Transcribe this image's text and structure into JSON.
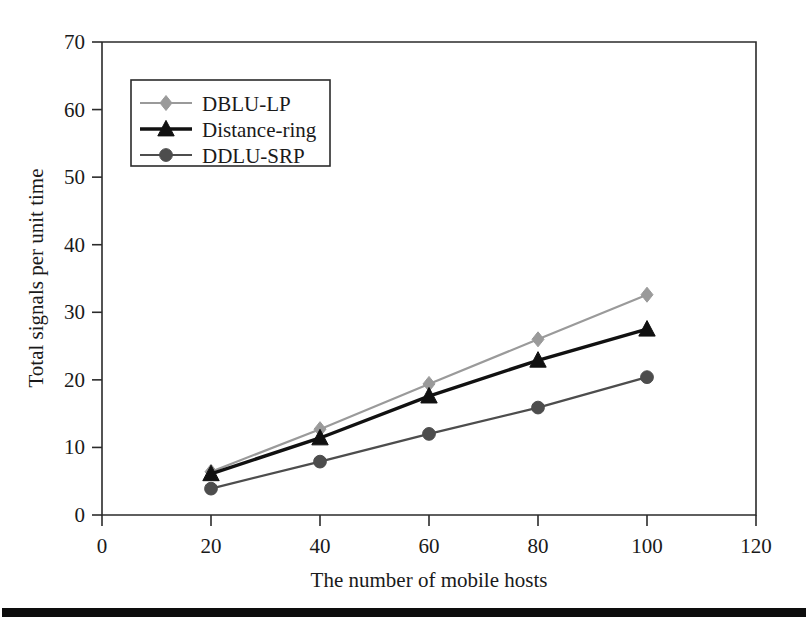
{
  "chart_data": {
    "type": "line",
    "title": "",
    "subtitle": "",
    "xlabel": "The number of mobile hosts",
    "ylabel": "Total signals per unit time",
    "x": [
      20,
      40,
      60,
      80,
      100
    ],
    "xlim": [
      0,
      120
    ],
    "ylim": [
      0,
      70
    ],
    "xticks": [
      0,
      20,
      40,
      60,
      80,
      100,
      120
    ],
    "yticks": [
      0,
      10,
      20,
      30,
      40,
      50,
      60,
      70
    ],
    "grid": false,
    "legend_position": "upper-left-inside",
    "series": [
      {
        "name": "DBLU-LP",
        "values": [
          6.4,
          12.7,
          19.4,
          26.0,
          32.6
        ],
        "color": "#9a9a9a",
        "marker": "diamond"
      },
      {
        "name": "Distance-ring",
        "values": [
          6.1,
          11.4,
          17.6,
          22.9,
          27.5
        ],
        "color": "#111111",
        "marker": "triangle"
      },
      {
        "name": "DDLU-SRP",
        "values": [
          3.9,
          7.9,
          12.0,
          15.9,
          20.4
        ],
        "color": "#4d4d4d",
        "marker": "circle"
      }
    ]
  },
  "axes": {
    "x_tick_labels": [
      "0",
      "20",
      "40",
      "60",
      "80",
      "100",
      "120"
    ],
    "y_tick_labels": [
      "0",
      "10",
      "20",
      "30",
      "40",
      "50",
      "60",
      "70"
    ],
    "x_axis_title": "The number of mobile hosts",
    "y_axis_title": "Total signals per unit time"
  },
  "legend": {
    "entries": [
      {
        "label": "DBLU-LP"
      },
      {
        "label": "Distance-ring"
      },
      {
        "label": "DDLU-SRP"
      }
    ]
  },
  "footer": {
    "rule_visible": "true"
  }
}
